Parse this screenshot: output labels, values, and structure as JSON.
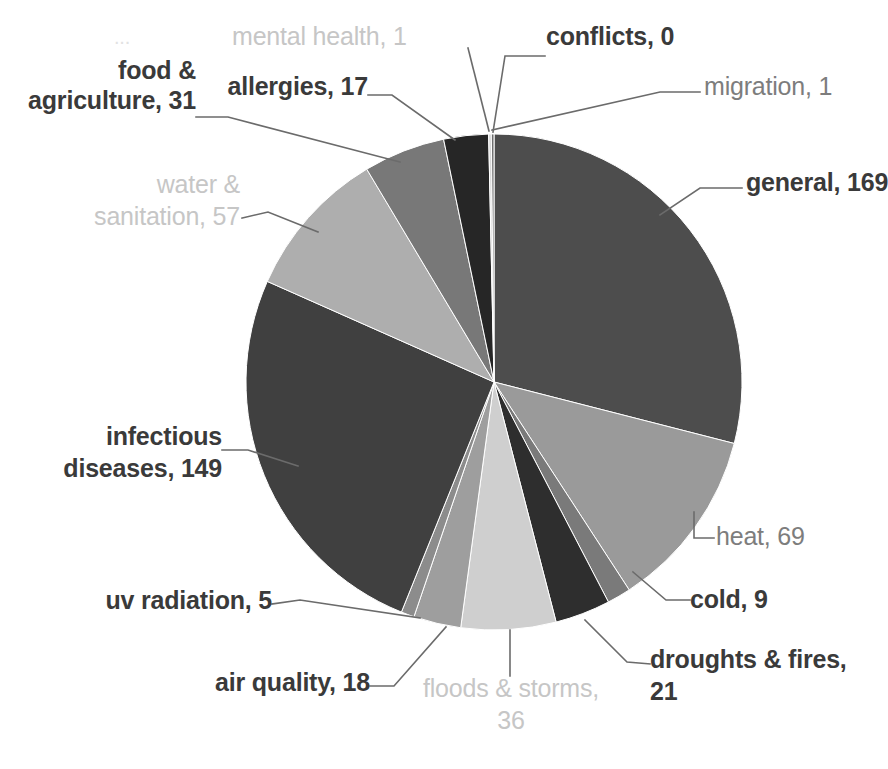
{
  "chart_data": {
    "type": "pie",
    "title": "",
    "subtitle": "",
    "xlabel": "",
    "ylabel": "",
    "grid": false,
    "legend_position": "none",
    "label_format": "category, value",
    "total": 583,
    "start_angle_deg": 0,
    "direction": "clockwise",
    "categories": [
      "general",
      "heat",
      "cold",
      "droughts & fires",
      "floods & storms",
      "air quality",
      "uv radiation",
      "infectious diseases",
      "water & sanitation",
      "food & agriculture",
      "allergies",
      "mental health",
      "conflicts",
      "migration"
    ],
    "values": [
      169,
      69,
      9,
      21,
      36,
      18,
      5,
      149,
      57,
      31,
      17,
      1,
      0,
      1
    ],
    "colors": [
      "#4d4d4d",
      "#9a9a9a",
      "#7a7a7a",
      "#2e2e2e",
      "#cfcfcf",
      "#9e9e9e",
      "#8c8c8c",
      "#404040",
      "#aeaeae",
      "#787878",
      "#262626",
      "#d6d6d6",
      "#5a5a5a",
      "#6e6e6e"
    ],
    "slices": [
      {
        "label": "general",
        "value": 169,
        "color": "#4d4d4d"
      },
      {
        "label": "heat",
        "value": 69,
        "color": "#9a9a9a"
      },
      {
        "label": "cold",
        "value": 9,
        "color": "#7a7a7a"
      },
      {
        "label": "droughts & fires",
        "value": 21,
        "color": "#2e2e2e"
      },
      {
        "label": "floods & storms",
        "value": 36,
        "color": "#cfcfcf"
      },
      {
        "label": "air quality",
        "value": 18,
        "color": "#9e9e9e"
      },
      {
        "label": "uv radiation",
        "value": 5,
        "color": "#8c8c8c"
      },
      {
        "label": "infectious diseases",
        "value": 149,
        "color": "#404040"
      },
      {
        "label": "water & sanitation",
        "value": 57,
        "color": "#aeaeae"
      },
      {
        "label": "food & agriculture",
        "value": 31,
        "color": "#787878"
      },
      {
        "label": "allergies",
        "value": 17,
        "color": "#262626"
      },
      {
        "label": "mental health",
        "value": 1,
        "color": "#d6d6d6"
      },
      {
        "label": "conflicts",
        "value": 0,
        "color": "#5a5a5a"
      },
      {
        "label": "migration",
        "value": 1,
        "color": "#6e6e6e"
      }
    ]
  },
  "labels": {
    "food_agriculture_line1": "food &",
    "food_agriculture_line2": "agriculture, 31",
    "allergies": "allergies, 17",
    "mental_health": "mental health, 1",
    "conflicts": "conflicts, 0",
    "migration": "migration, 1",
    "general": "general, 169",
    "water_sanitation_line1": "water &",
    "water_sanitation_line2": "sanitation, 57",
    "infectious_line1": "infectious",
    "infectious_line2": "diseases, 149",
    "heat": "heat, 69",
    "cold": "cold, 9",
    "droughts_line1": "droughts & fires,",
    "droughts_line2": "21",
    "uv_radiation": "uv radiation, 5",
    "air_quality": "air quality, 18",
    "floods_line1": "floods & storms,",
    "floods_line2": "36",
    "ghost_top_left": "..."
  },
  "style": {
    "bold_text_color": "#3a3a3a",
    "mid_text_color": "#7d7d7d",
    "faint_text_color": "#c6c6c6",
    "leader_line_color": "#6b6b6b",
    "background": "#ffffff"
  },
  "geometry": {
    "center_x": 494,
    "center_y": 382,
    "radius": 248
  }
}
